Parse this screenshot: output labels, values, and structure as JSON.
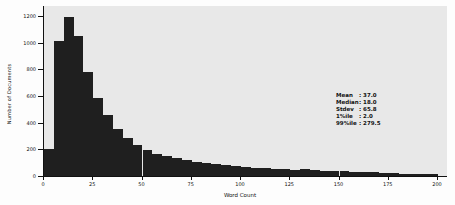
{
  "chart_data": {
    "type": "bar",
    "subtype": "histogram",
    "title": "",
    "xlabel": "Word Count",
    "ylabel": "Number of Documents",
    "xlim": [
      0,
      200
    ],
    "ylim": [
      0,
      1200
    ],
    "grid": false,
    "bin_start": 0,
    "bin_width": 5,
    "x_ticks": [
      0,
      25,
      50,
      75,
      100,
      125,
      150,
      175,
      200
    ],
    "y_ticks": [
      0,
      200,
      400,
      600,
      800,
      1000,
      1200
    ],
    "values": [
      205,
      1010,
      1190,
      1050,
      780,
      585,
      455,
      355,
      285,
      232,
      195,
      168,
      148,
      132,
      118,
      106,
      96,
      88,
      80,
      74,
      68,
      63,
      58,
      54,
      50,
      47,
      50,
      44,
      40,
      37,
      34,
      32,
      30,
      28,
      26,
      22,
      18,
      16,
      18,
      15
    ],
    "bar_color": "#1f1f1f",
    "panel_color": "#e8e8e8",
    "annotation": {
      "position": "right-middle",
      "stats": [
        {
          "label": "Mean",
          "value": "37.0"
        },
        {
          "label": "Median",
          "value": "18.0"
        },
        {
          "label": "Stdev",
          "value": "65.8"
        },
        {
          "label": "1%ile",
          "value": "2.0"
        },
        {
          "label": "99%ile",
          "value": "279.5"
        }
      ]
    }
  }
}
